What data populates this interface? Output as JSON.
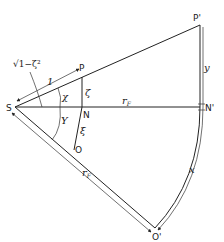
{
  "diagram": {
    "points": {
      "S": "S",
      "P": "P",
      "P_prime": "P'",
      "N": "N",
      "N_prime": "N'",
      "O": "O",
      "O_prime": "O'"
    },
    "labels": {
      "sqrt_expr": "√1−ζ²",
      "unit": "1",
      "chi": "χ",
      "upsilon": "Υ",
      "zeta": "ζ",
      "xi": "ξ",
      "r_F_top": "r",
      "r_F_top_sub": "F",
      "r_F_bottom": "r",
      "r_F_bottom_sub": "F",
      "y": "y",
      "x": "x"
    },
    "colors": {
      "line": "#222222",
      "background": "#ffffff"
    }
  }
}
